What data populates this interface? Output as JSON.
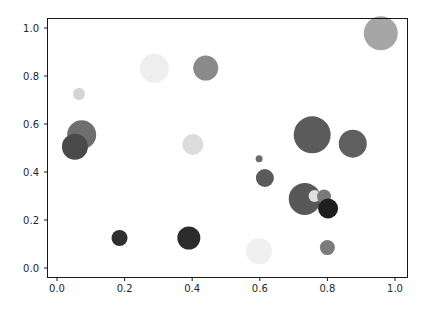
{
  "figure": {
    "background_color": "#ffffff",
    "width": 432,
    "height": 311
  },
  "chart_data": {
    "type": "scatter",
    "title": "",
    "xlabel": "",
    "ylabel": "",
    "xlim": [
      -0.03,
      1.06
    ],
    "ylim": [
      -0.05,
      1.06
    ],
    "grid": false,
    "legend": false,
    "xticks": [
      0.0,
      0.2,
      0.4,
      0.6,
      0.8,
      1.0
    ],
    "xtick_labels": [
      "0.0",
      "0.2",
      "0.4",
      "0.6",
      "0.8",
      "1.0"
    ],
    "yticks": [
      0.0,
      0.2,
      0.4,
      0.6,
      0.8,
      1.0
    ],
    "ytick_labels": [
      "0.0",
      "0.2",
      "0.4",
      "0.6",
      "0.8",
      "1.0"
    ],
    "marker": "circle",
    "colormap": "greys",
    "size_encoding": "area",
    "points": [
      {
        "x": 0.065,
        "y": 0.725,
        "r": 6.0,
        "color": "#d4d4d4"
      },
      {
        "x": 0.073,
        "y": 0.555,
        "r": 14.5,
        "color": "#6e6e6e"
      },
      {
        "x": 0.053,
        "y": 0.505,
        "r": 13.0,
        "color": "#4a4a4a"
      },
      {
        "x": 0.185,
        "y": 0.125,
        "r": 8.0,
        "color": "#2f2f2f"
      },
      {
        "x": 0.288,
        "y": 0.832,
        "r": 14.5,
        "color": "#eeeeee"
      },
      {
        "x": 0.39,
        "y": 0.125,
        "r": 11.5,
        "color": "#2b2b2b"
      },
      {
        "x": 0.402,
        "y": 0.515,
        "r": 10.5,
        "color": "#dcdcdc"
      },
      {
        "x": 0.44,
        "y": 0.833,
        "r": 12.5,
        "color": "#8a8a8a"
      },
      {
        "x": 0.598,
        "y": 0.455,
        "r": 3.5,
        "color": "#6b6b6b"
      },
      {
        "x": 0.598,
        "y": 0.07,
        "r": 13.0,
        "color": "#f0f0f0"
      },
      {
        "x": 0.615,
        "y": 0.375,
        "r": 9.0,
        "color": "#5a5a5a"
      },
      {
        "x": 0.733,
        "y": 0.288,
        "r": 16.0,
        "color": "#585858"
      },
      {
        "x": 0.762,
        "y": 0.3,
        "r": 6.0,
        "color": "#e0e0e0"
      },
      {
        "x": 0.755,
        "y": 0.555,
        "r": 18.5,
        "color": "#5b5b5b"
      },
      {
        "x": 0.79,
        "y": 0.298,
        "r": 7.0,
        "color": "#7a7a7a"
      },
      {
        "x": 0.802,
        "y": 0.248,
        "r": 10.0,
        "color": "#1f1f1f"
      },
      {
        "x": 0.8,
        "y": 0.085,
        "r": 7.5,
        "color": "#7b7b7b"
      },
      {
        "x": 0.875,
        "y": 0.518,
        "r": 14.0,
        "color": "#5f5f5f"
      },
      {
        "x": 0.958,
        "y": 0.978,
        "r": 17.0,
        "color": "#a6a6a6"
      }
    ]
  },
  "axes": {
    "spine_color": "#000000",
    "tick_color": "#000000",
    "tick_label_color": "#262626"
  }
}
